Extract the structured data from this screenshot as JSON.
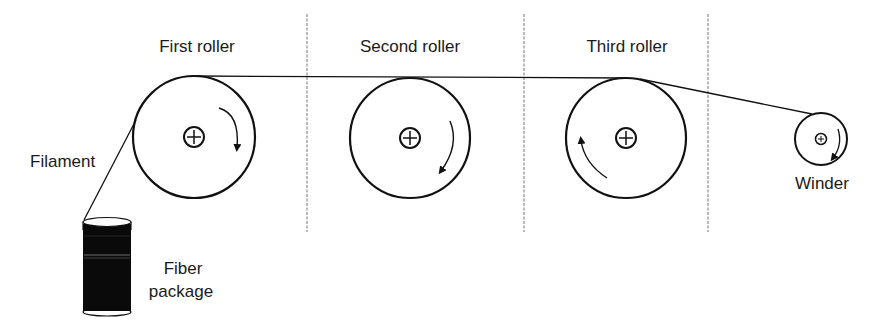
{
  "labels": {
    "first_roller": "First roller",
    "second_roller": "Second roller",
    "third_roller": "Third roller",
    "winder": "Winder",
    "filament": "Filament",
    "fiber_package_line1": "Fiber",
    "fiber_package_line2": "package"
  },
  "rollers": [
    {
      "name": "First roller",
      "cx": 194,
      "cy": 137,
      "r": 61,
      "rotation": "clockwise"
    },
    {
      "name": "Second roller",
      "cx": 410,
      "cy": 138,
      "r": 60,
      "rotation": "clockwise"
    },
    {
      "name": "Third roller",
      "cx": 626,
      "cy": 138,
      "r": 60,
      "rotation": "counter-clockwise"
    },
    {
      "name": "Winder",
      "cx": 821,
      "cy": 139,
      "r": 26,
      "rotation": "clockwise"
    }
  ],
  "colors": {
    "line": "#111111",
    "divider": "#777777",
    "package": "#0a0a0a"
  }
}
